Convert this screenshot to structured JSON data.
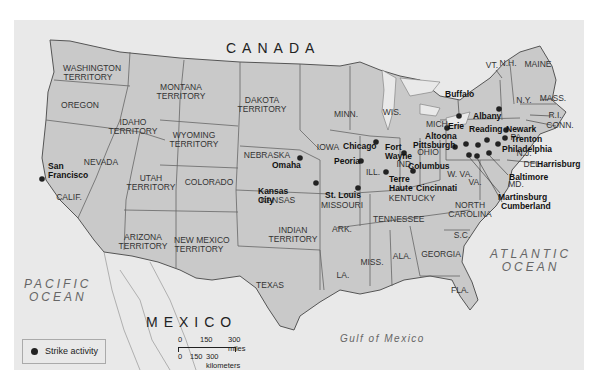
{
  "title_region": {
    "country_north": "CANADA",
    "country_south": "MEXICO"
  },
  "water": {
    "pacific": [
      "PACIFIC",
      "OCEAN"
    ],
    "atlantic": [
      "ATLANTIC",
      "OCEAN"
    ],
    "gulf": "Gulf of Mexico"
  },
  "states": [
    {
      "name": "WASHINGTON\nTERRITORY",
      "x": 88,
      "y": 68
    },
    {
      "name": "OREGON",
      "x": 80,
      "y": 105
    },
    {
      "name": "MONTANA\nTERRITORY",
      "x": 181,
      "y": 87
    },
    {
      "name": "IDAHO\nTERRITORY",
      "x": 133,
      "y": 122
    },
    {
      "name": "DAKOTA\nTERRITORY",
      "x": 262,
      "y": 100
    },
    {
      "name": "WYOMING\nTERRITORY",
      "x": 194,
      "y": 135
    },
    {
      "name": "NEBRASKA",
      "x": 267,
      "y": 155
    },
    {
      "name": "NEVADA",
      "x": 101,
      "y": 162
    },
    {
      "name": "UTAH\nTERRITORY",
      "x": 151,
      "y": 178
    },
    {
      "name": "COLORADO",
      "x": 209,
      "y": 182
    },
    {
      "name": "CALIF.",
      "x": 69,
      "y": 197
    },
    {
      "name": "KANSAS",
      "x": 278,
      "y": 200
    },
    {
      "name": "ARIZONA\nTERRITORY",
      "x": 143,
      "y": 237
    },
    {
      "name": "NEW MEXICO\nTERRITORY",
      "x": 199,
      "y": 240
    },
    {
      "name": "INDIAN\nTERRITORY",
      "x": 293,
      "y": 230
    },
    {
      "name": "TEXAS",
      "x": 270,
      "y": 285
    },
    {
      "name": "MINN.",
      "x": 346,
      "y": 114
    },
    {
      "name": "WIS.",
      "x": 392,
      "y": 112
    },
    {
      "name": "IOWA",
      "x": 328,
      "y": 147
    },
    {
      "name": "MICH.",
      "x": 438,
      "y": 124
    },
    {
      "name": "ILL.",
      "x": 373,
      "y": 172
    },
    {
      "name": "IND.",
      "x": 405,
      "y": 164
    },
    {
      "name": "OHIO",
      "x": 428,
      "y": 152
    },
    {
      "name": "MISSOURI",
      "x": 342,
      "y": 205
    },
    {
      "name": "KENTUCKY",
      "x": 412,
      "y": 198
    },
    {
      "name": "W. VA.",
      "x": 460,
      "y": 174
    },
    {
      "name": "VA.",
      "x": 475,
      "y": 182
    },
    {
      "name": "TENNESSEE",
      "x": 398,
      "y": 219
    },
    {
      "name": "NORTH\nCAROLINA",
      "x": 470,
      "y": 205
    },
    {
      "name": "ARK.",
      "x": 342,
      "y": 229
    },
    {
      "name": "S.C.",
      "x": 462,
      "y": 235
    },
    {
      "name": "MISS.",
      "x": 372,
      "y": 262
    },
    {
      "name": "ALA.",
      "x": 402,
      "y": 256
    },
    {
      "name": "GEORGIA",
      "x": 441,
      "y": 254
    },
    {
      "name": "LA.",
      "x": 343,
      "y": 275
    },
    {
      "name": "FLA.",
      "x": 460,
      "y": 290
    },
    {
      "name": "N.Y.",
      "x": 524,
      "y": 100
    },
    {
      "name": "PA.",
      "x": 517,
      "y": 137
    },
    {
      "name": "N.J.",
      "x": 524,
      "y": 153
    },
    {
      "name": "DEL.",
      "x": 533,
      "y": 164
    },
    {
      "name": "MD.",
      "x": 516,
      "y": 184
    },
    {
      "name": "VT.",
      "x": 492,
      "y": 65
    },
    {
      "name": "N.H.",
      "x": 508,
      "y": 63
    },
    {
      "name": "MAINE",
      "x": 538,
      "y": 64
    },
    {
      "name": "MASS.",
      "x": 553,
      "y": 98
    },
    {
      "name": "R.I.",
      "x": 555,
      "y": 115
    },
    {
      "name": "CONN.",
      "x": 560,
      "y": 125
    }
  ],
  "cities": [
    {
      "name": "San\nFrancisco",
      "label_x": 48,
      "label_y": 162,
      "dot_x": 42,
      "dot_y": 179
    },
    {
      "name": "Omaha",
      "label_x": 272,
      "label_y": 161,
      "dot_x": 300,
      "dot_y": 158
    },
    {
      "name": "Kansas\nCity",
      "label_x": 258,
      "label_y": 187,
      "dot_x": 316,
      "dot_y": 183
    },
    {
      "name": "St. Louis",
      "label_x": 325,
      "label_y": 191,
      "dot_x": 358,
      "dot_y": 188
    },
    {
      "name": "Chicago",
      "label_x": 343,
      "label_y": 142,
      "dot_x": 376,
      "dot_y": 142
    },
    {
      "name": "Peoria",
      "label_x": 334,
      "label_y": 157,
      "dot_x": 361,
      "dot_y": 161
    },
    {
      "name": "Fort\nWayne",
      "label_x": 385,
      "label_y": 143,
      "dot_x": 404,
      "dot_y": 153
    },
    {
      "name": "Terre\nHaute",
      "label_x": 389,
      "label_y": 175,
      "dot_x": 386,
      "dot_y": 172
    },
    {
      "name": "Columbus",
      "label_x": 408,
      "label_y": 162,
      "dot_x": 413,
      "dot_y": 171
    },
    {
      "name": "Cincinnati",
      "label_x": 416,
      "label_y": 184,
      "dot_x": 413,
      "dot_y": 171
    },
    {
      "name": "Buffalo",
      "label_x": 445,
      "label_y": 90,
      "dot_x": 459,
      "dot_y": 116
    },
    {
      "name": "Albany",
      "label_x": 473,
      "label_y": 112,
      "dot_x": 499,
      "dot_y": 109
    },
    {
      "name": "Erie",
      "label_x": 448,
      "label_y": 122,
      "dot_x": 447,
      "dot_y": 128
    },
    {
      "name": "Altoona",
      "label_x": 425,
      "label_y": 132,
      "dot_x": 466,
      "dot_y": 144
    },
    {
      "name": "Pittsburgh",
      "label_x": 413,
      "label_y": 141,
      "dot_x": 455,
      "dot_y": 147
    },
    {
      "name": "Reading",
      "label_x": 469,
      "label_y": 125,
      "dot_x": 487,
      "dot_y": 140
    },
    {
      "name": "Newark",
      "label_x": 506,
      "label_y": 125,
      "dot_x": 506,
      "dot_y": 130
    },
    {
      "name": "Trenton",
      "label_x": 511,
      "label_y": 135,
      "dot_x": 505,
      "dot_y": 138
    },
    {
      "name": "Philadelphia",
      "label_x": 502,
      "label_y": 145,
      "dot_x": 498,
      "dot_y": 144
    },
    {
      "name": "Harrisburg",
      "label_x": 537,
      "label_y": 160,
      "dot_x": 478,
      "dot_y": 145
    },
    {
      "name": "Baltimore",
      "label_x": 509,
      "label_y": 173,
      "dot_x": 489,
      "dot_y": 153
    },
    {
      "name": "Martinsburg",
      "label_x": 498,
      "label_y": 193,
      "dot_x": 469,
      "dot_y": 155
    },
    {
      "name": "Cumberland",
      "label_x": 501,
      "label_y": 202,
      "dot_x": 477,
      "dot_y": 156
    }
  ],
  "legend": {
    "label": "Strike activity"
  },
  "scale": {
    "miles_ticks": [
      "0",
      "150",
      "300 miles"
    ],
    "km_ticks": [
      "0",
      "150",
      "300 kilometers"
    ]
  },
  "colors": {
    "land_us": "#c9c9c9",
    "land_other": "#e9e9e9",
    "water": "#e9e9e9",
    "border": "#555555",
    "dot": "#222222"
  }
}
